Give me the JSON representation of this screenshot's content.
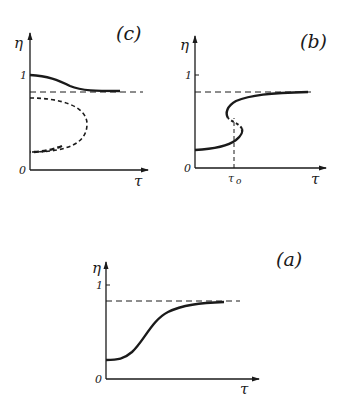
{
  "figure": {
    "panels": [
      {
        "id": "c",
        "label": "(c)",
        "y_axis_label": "η",
        "x_axis_label": "τ",
        "origin_label": "0",
        "y_tick_label": "1",
        "description": "Bistable: stable upper branch (solid) decays to asymptote; unstable/metastable closed dashed branch"
      },
      {
        "id": "b",
        "label": "(b)",
        "y_axis_label": "η",
        "x_axis_label": "τ",
        "origin_label": "0",
        "y_tick_label": "1",
        "x_marker_label": "τ",
        "x_marker_subscript": "o",
        "description": "S-shaped curve with hysteresis around τo; dashed vertical line at τo"
      },
      {
        "id": "a",
        "label": "(a)",
        "y_axis_label": "η",
        "x_axis_label": "τ",
        "origin_label": "0",
        "y_tick_label": "1",
        "description": "Monotonic sigmoid rise to dashed asymptote"
      }
    ],
    "colors": {
      "ink": "#1a1a1a",
      "background": "#ffffff"
    }
  }
}
